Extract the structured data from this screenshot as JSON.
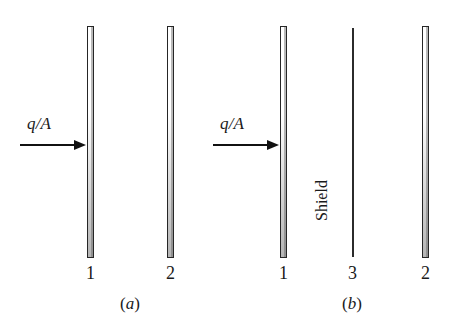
{
  "figure": {
    "type": "technical-diagram",
    "background_color": "#ffffff",
    "line_color": "#262626"
  },
  "panel_a": {
    "caption_paren_open": "(",
    "caption_letter": "a",
    "caption_paren_close": ")",
    "flux_label": "q/A",
    "arrow_name": "heat-flux-arrow",
    "plates": [
      {
        "label": "1",
        "name": "plate-1"
      },
      {
        "label": "2",
        "name": "plate-2"
      }
    ]
  },
  "panel_b": {
    "caption_paren_open": "(",
    "caption_letter": "b",
    "caption_paren_close": ")",
    "flux_label": "q/A",
    "arrow_name": "heat-flux-arrow",
    "shield_label": "Shield",
    "plates": [
      {
        "label": "1",
        "name": "plate-1"
      },
      {
        "label": "3",
        "name": "shield-3"
      },
      {
        "label": "2",
        "name": "plate-2"
      }
    ]
  }
}
